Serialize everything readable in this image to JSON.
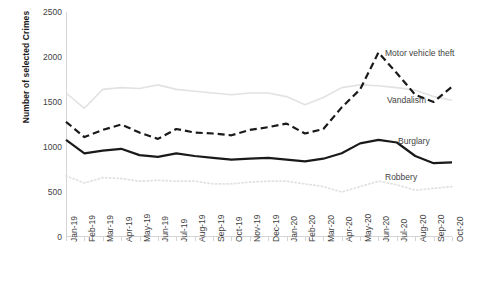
{
  "chart_data": {
    "type": "line",
    "title": "",
    "xlabel": "",
    "ylabel": "Number of selected Crimes",
    "ylim": [
      0,
      2500
    ],
    "yticks": [
      0,
      500,
      1000,
      1500,
      2000,
      2500
    ],
    "grid": false,
    "legend": "direct-labels-right",
    "categories": [
      "Jan-19",
      "Feb-19",
      "Mar-19",
      "Apr-19",
      "May-19",
      "Jun-19",
      "Jul-19",
      "Aug-19",
      "Sep-19",
      "Oct-19",
      "Nov-19",
      "Dec-19",
      "Jan-20",
      "Feb-20",
      "Mar-20",
      "Apr-20",
      "May-20",
      "Jun-20",
      "Jul-20",
      "Aug-20",
      "Sep-20",
      "Oct-20"
    ],
    "series": [
      {
        "name": "Vandalism",
        "style": "solid-light",
        "color": "#e2e2e2",
        "values": [
          1600,
          1430,
          1640,
          1660,
          1650,
          1690,
          1640,
          1620,
          1600,
          1580,
          1600,
          1600,
          1560,
          1470,
          1550,
          1660,
          1690,
          1680,
          1660,
          1630,
          1560,
          1520
        ]
      },
      {
        "name": "Motor vehicle theft",
        "style": "dashed-dark",
        "color": "#1a1a1a",
        "values": [
          1280,
          1110,
          1190,
          1250,
          1160,
          1090,
          1200,
          1160,
          1150,
          1130,
          1190,
          1220,
          1260,
          1150,
          1200,
          1440,
          1640,
          2050,
          1820,
          1580,
          1500,
          1670
        ]
      },
      {
        "name": "Burglary",
        "style": "solid-dark",
        "color": "#1a1a1a",
        "values": [
          1080,
          930,
          960,
          980,
          910,
          890,
          930,
          900,
          880,
          860,
          870,
          880,
          860,
          840,
          870,
          930,
          1040,
          1080,
          1050,
          900,
          820,
          830
        ]
      },
      {
        "name": "Robbery",
        "style": "dotted-light",
        "color": "#e2e2e2",
        "values": [
          680,
          600,
          660,
          650,
          620,
          630,
          620,
          620,
          590,
          590,
          610,
          620,
          620,
          590,
          560,
          500,
          560,
          620,
          580,
          520,
          540,
          560
        ]
      }
    ]
  },
  "axis": {
    "y_title": "Number of selected Crimes"
  },
  "labels": {
    "motor_vehicle_theft": "Motor vehicle theft",
    "vandalism": "Vandalism",
    "burglary": "Burglary",
    "robbery": "Robbery"
  }
}
